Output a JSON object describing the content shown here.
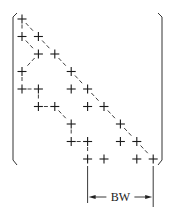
{
  "diagram": {
    "type": "symmetric-band-matrix-profile",
    "matrix_size": 9,
    "entry_symbol": "+",
    "entries": [
      {
        "row": 1,
        "cols": [
          1
        ]
      },
      {
        "row": 2,
        "cols": [
          1,
          2
        ]
      },
      {
        "row": 3,
        "cols": [
          2,
          3
        ]
      },
      {
        "row": 4,
        "cols": [
          1,
          4
        ]
      },
      {
        "row": 5,
        "cols": [
          1,
          2,
          4,
          5
        ]
      },
      {
        "row": 6,
        "cols": [
          2,
          3,
          5,
          6
        ]
      },
      {
        "row": 7,
        "cols": [
          4,
          7
        ]
      },
      {
        "row": 8,
        "cols": [
          4,
          5,
          7,
          8
        ]
      },
      {
        "row": 9,
        "cols": [
          5,
          6,
          8,
          9
        ]
      }
    ],
    "diagonal_line": {
      "from": [
        1,
        1
      ],
      "to": [
        9,
        9
      ],
      "style": "dashed"
    },
    "profile_line": {
      "style": "dashed",
      "path": [
        [
          1,
          1
        ],
        [
          2,
          1
        ],
        [
          3,
          2
        ],
        [
          4,
          1
        ],
        [
          5,
          1
        ],
        [
          5,
          2
        ],
        [
          6,
          2
        ],
        [
          6,
          3
        ],
        [
          7,
          4
        ],
        [
          8,
          4
        ],
        [
          8,
          5
        ],
        [
          9,
          5
        ]
      ]
    },
    "bandwidth": {
      "label": "BW",
      "from_col": 5,
      "to_col": 9
    }
  }
}
